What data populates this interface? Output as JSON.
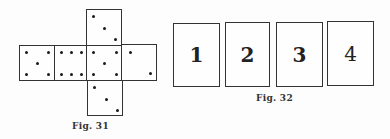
{
  "fig31": {
    "caption": "Fig. 31",
    "description": "Unfolded cube net of a die",
    "faces": [
      {
        "name": "top",
        "pips": 3
      },
      {
        "name": "left",
        "pips": 5
      },
      {
        "name": "left-middle",
        "pips": 6
      },
      {
        "name": "center",
        "pips": 5
      },
      {
        "name": "right",
        "pips": 2
      },
      {
        "name": "bottom",
        "pips": 3
      }
    ]
  },
  "fig32": {
    "caption": "Fig. 32",
    "cards": [
      {
        "label": "1"
      },
      {
        "label": "2"
      },
      {
        "label": "3"
      },
      {
        "label": "4"
      }
    ]
  }
}
